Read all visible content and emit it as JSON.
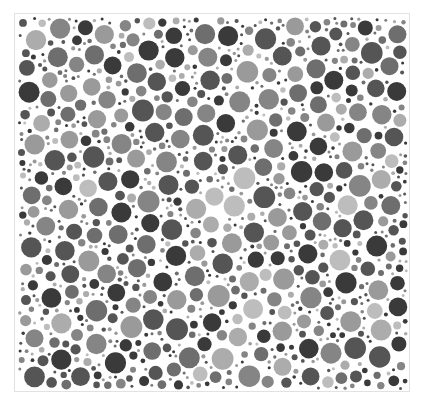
{
  "figure": {
    "type": "dot-pattern-plate",
    "frame": {
      "x": 14,
      "y": 13,
      "width": 396,
      "height": 379,
      "border_color": "#e2e2e2",
      "background": "#ffffff"
    },
    "palette": [
      "#3a3a3a",
      "#555555",
      "#6e6e6e",
      "#858585",
      "#9a9a9a",
      "#acacac",
      "#bdbdbd"
    ],
    "dot_radius_range": [
      1.5,
      11
    ],
    "seed": 7
  }
}
